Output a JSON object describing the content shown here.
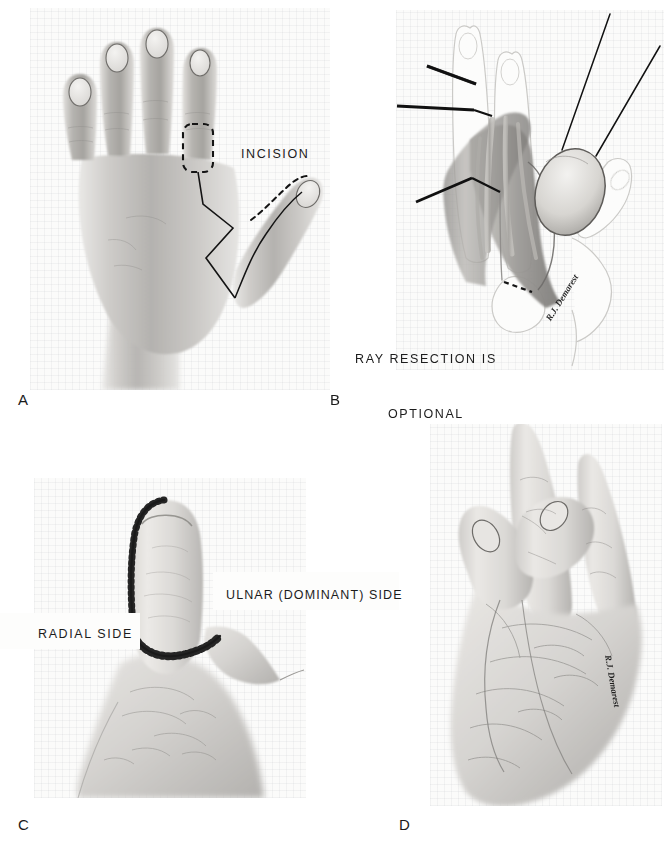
{
  "figure": {
    "background_color": "#ffffff",
    "paper_color": "#fbfbfa",
    "ink_color": "#1a1a1a",
    "width": 671,
    "height": 851
  },
  "panels": [
    {
      "id": "A",
      "letter": "A",
      "caption_position": {
        "x": 18,
        "y": 392
      },
      "view": "dorsal view of left hand with planned incision markings",
      "photo": {
        "x": 30,
        "y": 8,
        "w": 300,
        "h": 382
      }
    },
    {
      "id": "B",
      "letter": "B",
      "caption_position": {
        "x": 330,
        "y": 392
      },
      "view": "surgical exposure with retractors, neurovascular island flap pedicle and ray resection detail",
      "photo": {
        "x": 396,
        "y": 10,
        "w": 268,
        "h": 360
      }
    },
    {
      "id": "C",
      "letter": "C",
      "caption_position": {
        "x": 18,
        "y": 817
      },
      "view": "palmar view of reconstructed thumb showing suture lines",
      "photo": {
        "x": 34,
        "y": 478,
        "w": 272,
        "h": 320
      }
    },
    {
      "id": "D",
      "letter": "D",
      "caption_position": {
        "x": 399,
        "y": 817
      },
      "view": "functional pinch between reconstructed thumb and index finger",
      "photo": {
        "x": 430,
        "y": 424,
        "w": 232,
        "h": 382
      }
    }
  ],
  "labels": [
    {
      "id": "incision",
      "text": "INCISION",
      "panel": "A",
      "x": 241,
      "y": 145
    },
    {
      "id": "ray-resection",
      "line1": "RAY RESECTION IS",
      "line2": "OPTIONAL",
      "panel": "B",
      "x": 355,
      "y": 314
    },
    {
      "id": "radial-side",
      "text": "RADIAL SIDE",
      "panel": "C",
      "x": 38,
      "y": 625
    },
    {
      "id": "ulnar-side",
      "text": "ULNAR (DOMINANT) SIDE",
      "panel": "C",
      "x": 226,
      "y": 586
    }
  ],
  "annotations": {
    "panel_a": {
      "dashed_rect": "dashed flap outline on dorsum of index finger",
      "solid_line": "zigzag incision line from index web to first web space",
      "dashed_curve": "dashed incision outline on thumb tip"
    },
    "panel_b": {
      "retractor_count_left": 3,
      "pointer_count_right": 2,
      "dashed_line": "dashed osteotomy line at proximal phalanx"
    },
    "panel_c": {
      "suture_line": "interrupted sutures along radial border and base of thumb"
    }
  },
  "signatures": [
    {
      "id": "signature-b",
      "text": "R.J. Demarest",
      "panel": "B",
      "x": 556,
      "y": 322,
      "rotate": -58,
      "size": 9
    },
    {
      "id": "signature-d",
      "text": "R.J. Demarest",
      "panel": "D",
      "x": 606,
      "y": 655,
      "rotate": 80,
      "size": 9
    }
  ]
}
